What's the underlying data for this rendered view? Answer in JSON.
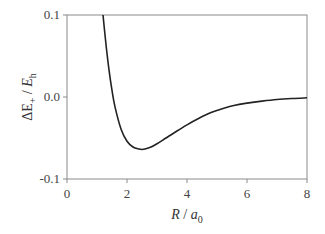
{
  "chart_data": {
    "type": "line",
    "title": "",
    "xlabel": "R / a0",
    "ylabel": "ΔE+ / Eh",
    "xlim": [
      0,
      8
    ],
    "ylim": [
      -0.1,
      0.1
    ],
    "x_ticks": [
      0,
      2,
      4,
      6,
      8
    ],
    "x_tick_labels": [
      "0",
      "2",
      "4",
      "6",
      "8"
    ],
    "y_ticks": [
      0.1,
      0.0,
      -0.1
    ],
    "y_tick_labels": [
      "0.1",
      "0.0",
      "-0.1"
    ],
    "grid": false,
    "legend": null,
    "series": [
      {
        "name": "ΔE+",
        "color": "#222222",
        "x": [
          1.2,
          1.3,
          1.4,
          1.5,
          1.6,
          1.8,
          2.0,
          2.2,
          2.4,
          2.5,
          2.6,
          2.8,
          3.0,
          3.3,
          3.6,
          4.0,
          4.4,
          4.8,
          5.2,
          5.6,
          6.0,
          6.5,
          7.0,
          7.5,
          8.0
        ],
        "y": [
          0.1,
          0.064,
          0.033,
          0.008,
          -0.012,
          -0.039,
          -0.054,
          -0.061,
          -0.0635,
          -0.064,
          -0.0635,
          -0.061,
          -0.057,
          -0.05,
          -0.043,
          -0.034,
          -0.026,
          -0.019,
          -0.014,
          -0.01,
          -0.0075,
          -0.005,
          -0.003,
          -0.0018,
          -0.001
        ]
      }
    ]
  },
  "labels": {
    "x_axis_main": "R",
    "x_axis_sep": " / ",
    "x_axis_unit": "a",
    "x_axis_unit_sub": "0",
    "y_axis_main": "ΔE",
    "y_axis_main_sub": "+",
    "y_axis_sep": " / ",
    "y_axis_unit": "E",
    "y_axis_unit_sub": "h"
  }
}
